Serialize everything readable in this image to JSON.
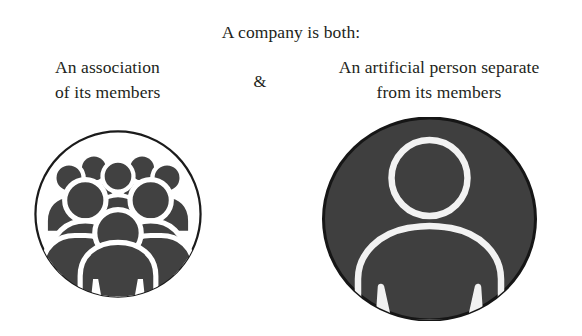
{
  "figure": {
    "headline": "A company is both:",
    "conjunction": "&",
    "left_branch": {
      "line1": "An association",
      "line2": "of its members",
      "icon_name": "group-of-people-icon",
      "icon_style": "white circle with dark outline, filled dark-gray crowd silhouette"
    },
    "right_branch": {
      "line1": "An artificial person separate",
      "line2": "from its members",
      "icon_name": "single-person-icon",
      "icon_style": "solid dark-gray circle with white outlined single person"
    }
  },
  "colors": {
    "text": "#231f20",
    "background": "#ffffff",
    "dark_gray": "#414141",
    "circle_outline": "#1b1b1b",
    "person_outline": "#f2f2f2"
  }
}
